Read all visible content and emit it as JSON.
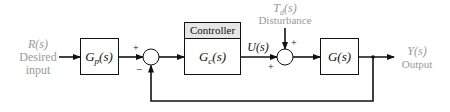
{
  "diagram": {
    "type": "block-diagram",
    "colors": {
      "line": "#111111",
      "label_gray": "#9a9a9a",
      "controller_header": "#e6e6e6"
    },
    "input": {
      "signal": "R(s)",
      "line1": "Desired",
      "line2": "input"
    },
    "prefilter": {
      "label": "G_p(s)",
      "main": "G",
      "sub": "p",
      "tail": "(s)"
    },
    "sum1": {
      "plus_sign": "+",
      "minus_sign": "−"
    },
    "controller": {
      "header": "Controller",
      "main": "G",
      "sub": "c",
      "tail": "(s)"
    },
    "control_signal": {
      "label": "U(s)"
    },
    "disturbance": {
      "main": "T",
      "sub": "d",
      "tail": "(s)",
      "name": "Disturbance"
    },
    "sum2": {
      "plus_top": "+",
      "plus_left": "+"
    },
    "plant": {
      "label": "G(s)"
    },
    "output": {
      "signal": "Y(s)",
      "name": "Output"
    },
    "connections": [
      "R(s) -> G_p(s)",
      "G_p(s) -> sum1 (+)",
      "sum1 -> G_c(s)",
      "G_c(s) -> sum2 (+) [U(s)]",
      "T_d(s) -> sum2 (+)",
      "sum2 -> G(s)",
      "G(s) -> Y(s)",
      "Y(s) -> sum1 (−) [feedback]"
    ]
  }
}
